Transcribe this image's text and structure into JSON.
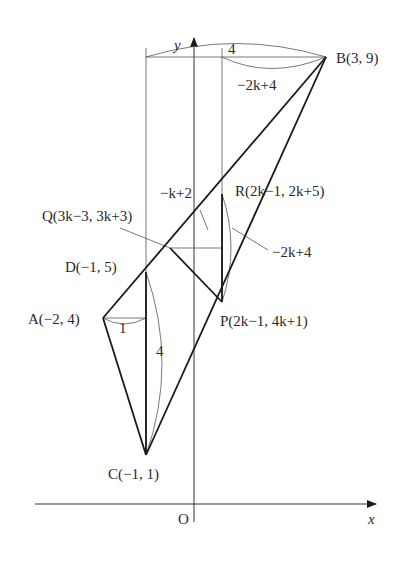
{
  "diagram": {
    "axes": {
      "x_label": "x",
      "y_label": "y",
      "origin_label": "O"
    },
    "points": {
      "A": {
        "name": "A",
        "coords": "(−2, 4)"
      },
      "B": {
        "name": "B",
        "coords": "(3, 9)"
      },
      "C": {
        "name": "C",
        "coords": "(−1, 1)"
      },
      "D": {
        "name": "D",
        "coords": "(−1, 5)"
      },
      "P": {
        "name": "P",
        "coords": "(2k−1, 4k+1)"
      },
      "Q": {
        "name": "Q",
        "coords": "(3k−3, 3k+3)"
      },
      "R": {
        "name": "R",
        "coords": "(2k−1, 2k+5)"
      }
    },
    "measurements": {
      "top_width": "4",
      "BR_horizontal": "−2k+4",
      "QR_horizontal": "−k+2",
      "PR_vertical": "−2k+4",
      "AD_horizontal": "1",
      "CD_vertical": "4"
    }
  }
}
